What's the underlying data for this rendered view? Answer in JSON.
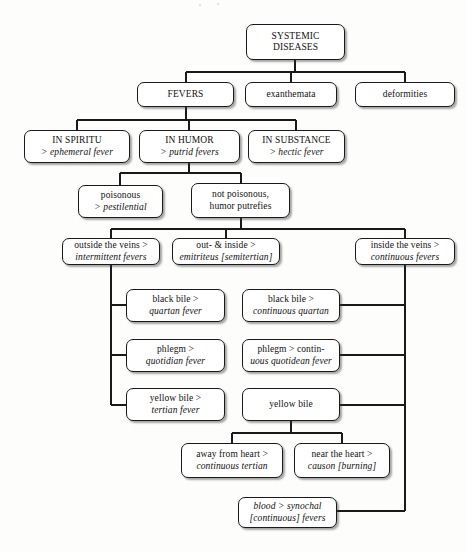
{
  "diagram": {
    "line_color": "#1a1a1a",
    "box_fill": "#ffffff",
    "nodes": [
      {
        "id": "root",
        "line1": "SYSTEMIC",
        "line2": "DISEASES",
        "style": "caps"
      },
      {
        "id": "fevers",
        "line1": "FEVERS",
        "line2": "",
        "style": "caps"
      },
      {
        "id": "exanthemata",
        "line1": "exanthemata",
        "line2": "",
        "style": "plain"
      },
      {
        "id": "deformities",
        "line1": "deformities",
        "line2": "",
        "style": "plain"
      },
      {
        "id": "spiritu",
        "line1": "IN SPIRITU",
        "line2": "> ephemeral fever",
        "style": "caps-italic"
      },
      {
        "id": "humor",
        "line1": "IN HUMOR",
        "line2": "> putrid fevers",
        "style": "caps-italic"
      },
      {
        "id": "substance",
        "line1": "IN SUBSTANCE",
        "line2": "> hectic fever",
        "style": "caps-italic"
      },
      {
        "id": "poisonous",
        "line1": "poisonous",
        "line2": "> pestilential",
        "style": "plain-italic"
      },
      {
        "id": "notpoison",
        "line1": "not poisonous,",
        "line2": "humor putrefies",
        "style": "plain"
      },
      {
        "id": "outside",
        "line1": "outside the veins >",
        "line2": "intermittent fevers",
        "style": "plain-italic"
      },
      {
        "id": "outin",
        "line1": "out- & inside >",
        "line2": "emitriteus [semitertian]",
        "style": "plain-mixed"
      },
      {
        "id": "inside",
        "line1": "inside the veins >",
        "line2": "continuous fevers",
        "style": "plain-italic"
      },
      {
        "id": "blackbile",
        "line1": "black bile >",
        "line2": "quartan fever",
        "style": "plain-italic"
      },
      {
        "id": "blackbile2",
        "line1": "black bile >",
        "line2": "continuous quartan",
        "style": "plain-italic"
      },
      {
        "id": "phlegm",
        "line1": "phlegm >",
        "line2": "quotidian fever",
        "style": "plain-italic"
      },
      {
        "id": "phlegm2",
        "line1": "phlegm > contin-",
        "line2": "uous quotidean fever",
        "style": "mixed-italic"
      },
      {
        "id": "yellowbile",
        "line1": "yellow bile >",
        "line2": "tertian fever",
        "style": "plain-italic"
      },
      {
        "id": "yellowbile2",
        "line1": "yellow bile",
        "line2": "",
        "style": "plain"
      },
      {
        "id": "awayheart",
        "line1": "away from heart >",
        "line2": "continuous tertian",
        "style": "plain-italic"
      },
      {
        "id": "nearheart",
        "line1": "near the heart >",
        "line2": "causon [burning]",
        "style": "plain-mixed2"
      },
      {
        "id": "blood",
        "line1": "blood > synochal",
        "line2": "[continuous] fevers",
        "style": "mixed-italic2"
      }
    ]
  }
}
